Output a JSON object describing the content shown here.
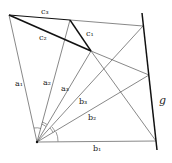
{
  "diagram": {
    "points": {
      "O": [
        37,
        142
      ],
      "A": [
        9,
        15
      ],
      "P": [
        70,
        20
      ],
      "Q": [
        91,
        51
      ],
      "G1": [
        143,
        26
      ],
      "G2": [
        149,
        75
      ],
      "G3": [
        156,
        141
      ],
      "gTop": [
        142,
        13
      ],
      "gBot": [
        157,
        150
      ]
    },
    "labels": {
      "c3": "c₃",
      "c2": "c₂",
      "c1": "c₁",
      "a1": "a₁",
      "a2": "a₂",
      "a3": "a₃",
      "b3": "b₃",
      "b2": "b₂",
      "b1": "b₁",
      "g": "g"
    },
    "colors": {
      "line": "#444444",
      "bold": "#111111"
    }
  }
}
